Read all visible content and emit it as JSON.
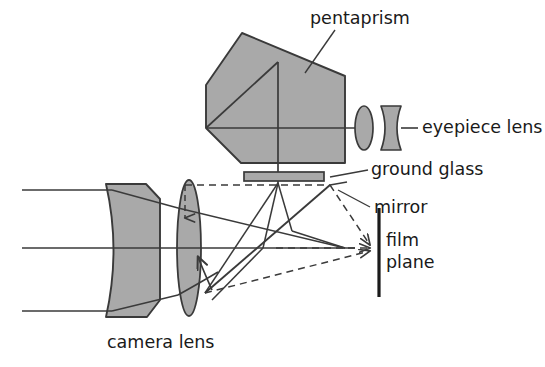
{
  "figure": {
    "background_color": "#ffffff",
    "line_color": "#3a3a3a",
    "glass_fill_color": "#a9a9a9",
    "text_color": "#1a1a1a"
  },
  "labels": {
    "pentaprism": "pentaprism",
    "eyepiece_lens": "eyepiece lens",
    "ground_glass": "ground glass",
    "mirror": "mirror",
    "film_line1": "film",
    "film_line2": "plane",
    "camera_lens": "camera lens"
  },
  "components": [
    {
      "name": "pentaprism",
      "label": "pentaprism",
      "kind": "prism"
    },
    {
      "name": "eyepiece-lens",
      "label": "eyepiece lens",
      "kind": "lens-pair"
    },
    {
      "name": "ground-glass",
      "label": "ground glass",
      "kind": "plate"
    },
    {
      "name": "mirror",
      "label": "mirror",
      "kind": "reflector"
    },
    {
      "name": "film-plane",
      "label": "film plane",
      "kind": "plane"
    },
    {
      "name": "camera-lens",
      "label": "camera lens",
      "kind": "lens-group"
    }
  ],
  "rays": {
    "incoming_count": 3,
    "style_solid": "light path to viewfinder",
    "style_dashed": "light path to film plane"
  }
}
